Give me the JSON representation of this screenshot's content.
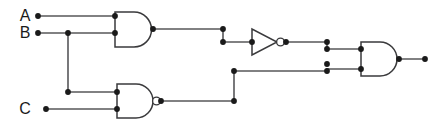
{
  "diagram": {
    "type": "digital-logic-schematic",
    "canvas": {
      "width": 444,
      "height": 126,
      "background": "#ffffff"
    },
    "colors": {
      "wire": "#58585a",
      "gate_outline": "#3a3a3c",
      "gate_fill": "#ffffff",
      "node": "#1a1a1a",
      "label": "#1a1a1a"
    }
  },
  "inputs": [
    {
      "id": "A",
      "label": "A",
      "label_x": 25,
      "label_y": 16,
      "terminal_x": 38,
      "terminal_y": 16
    },
    {
      "id": "B",
      "label": "B",
      "label_x": 25,
      "label_y": 33,
      "terminal_x": 38,
      "terminal_y": 33
    },
    {
      "id": "C",
      "label": "C",
      "label_x": 25,
      "label_y": 109,
      "terminal_x": 46,
      "terminal_y": 109
    }
  ],
  "gates": [
    {
      "id": "and1",
      "type": "AND",
      "label": "AND",
      "inverted_output": false,
      "x": 115,
      "y": 12,
      "width": 38,
      "height": 35,
      "inputs": [
        "A",
        "B"
      ],
      "output_node": {
        "x": 153,
        "y": 29
      }
    },
    {
      "id": "nand1",
      "type": "NAND",
      "label": "NAND",
      "inverted_output": true,
      "x": 117,
      "y": 84,
      "width": 38,
      "height": 34,
      "inputs": [
        "B",
        "C"
      ],
      "output_node": {
        "x": 161,
        "y": 101
      }
    },
    {
      "id": "not1",
      "type": "NOT",
      "label": "NOT",
      "inverted_output": true,
      "x": 252,
      "y": 29,
      "width": 30,
      "height": 26,
      "inputs": [
        "and1"
      ],
      "output_node": {
        "x": 286,
        "y": 42
      }
    },
    {
      "id": "and2",
      "type": "AND",
      "label": "AND",
      "inverted_output": false,
      "x": 361,
      "y": 42,
      "width": 38,
      "height": 34,
      "inputs": [
        "not1",
        "nand1"
      ],
      "output_node": {
        "x": 399,
        "y": 59
      }
    }
  ],
  "output": {
    "id": "OUT",
    "label": "",
    "terminal_x": 425,
    "terminal_y": 59
  },
  "wires": [
    {
      "id": "a-to-and1",
      "from": "A",
      "to": "and1.in1",
      "path": "M38,16 L115,16"
    },
    {
      "id": "b-to-and1",
      "from": "B",
      "to": "and1.in2",
      "path": "M38,33 L115,33"
    },
    {
      "id": "b-branch-down",
      "from": "B",
      "to": "nand1.in1",
      "path": "M68,33 L68,92 L117,92"
    },
    {
      "id": "c-to-nand1",
      "from": "C",
      "to": "nand1.in2",
      "path": "M46,109 L117,109"
    },
    {
      "id": "and1-to-not1",
      "from": "and1",
      "to": "not1.in",
      "path": "M153,29 L223,29 L223,42 L252,42"
    },
    {
      "id": "not1-to-and2",
      "from": "not1",
      "to": "and2.in1",
      "path": "M286,42 L327,42 L327,49 L361,49"
    },
    {
      "id": "nand1-to-and2",
      "from": "nand1",
      "to": "and2.in2",
      "path": "M161,101 L234,101 L234,71 L327,71 L327,69 L361,69"
    },
    {
      "id": "and2-to-out",
      "from": "and2",
      "to": "OUT",
      "path": "M399,59 L425,59"
    }
  ],
  "junction_dots": [
    {
      "id": "dot-a-terminal",
      "x": 38,
      "y": 16
    },
    {
      "id": "dot-b-terminal",
      "x": 38,
      "y": 33
    },
    {
      "id": "dot-c-terminal",
      "x": 46,
      "y": 109
    },
    {
      "id": "dot-b-branch",
      "x": 68,
      "y": 33
    },
    {
      "id": "dot-b-branch-corner",
      "x": 68,
      "y": 92
    },
    {
      "id": "dot-and1-in1",
      "x": 115,
      "y": 16
    },
    {
      "id": "dot-and1-in2",
      "x": 115,
      "y": 33
    },
    {
      "id": "dot-and1-out",
      "x": 153,
      "y": 29
    },
    {
      "id": "dot-nand1-in1",
      "x": 117,
      "y": 92
    },
    {
      "id": "dot-nand1-in2",
      "x": 117,
      "y": 109
    },
    {
      "id": "dot-nand1-out",
      "x": 161,
      "y": 101
    },
    {
      "id": "dot-and1-corner-top",
      "x": 223,
      "y": 29
    },
    {
      "id": "dot-and1-corner-bottom",
      "x": 223,
      "y": 42
    },
    {
      "id": "dot-not1-in",
      "x": 252,
      "y": 42
    },
    {
      "id": "dot-not1-out",
      "x": 286,
      "y": 42
    },
    {
      "id": "dot-nand1-corner-bottom",
      "x": 234,
      "y": 101
    },
    {
      "id": "dot-nand1-corner-top",
      "x": 234,
      "y": 71
    },
    {
      "id": "dot-and2-feed-upper-a",
      "x": 327,
      "y": 42
    },
    {
      "id": "dot-and2-feed-upper-b",
      "x": 327,
      "y": 49
    },
    {
      "id": "dot-and2-feed-lower-a",
      "x": 327,
      "y": 64
    },
    {
      "id": "dot-and2-feed-lower-b",
      "x": 327,
      "y": 71
    },
    {
      "id": "dot-and2-in1",
      "x": 361,
      "y": 49
    },
    {
      "id": "dot-and2-in2",
      "x": 361,
      "y": 69
    },
    {
      "id": "dot-and2-out",
      "x": 399,
      "y": 59
    },
    {
      "id": "dot-out-terminal",
      "x": 425,
      "y": 59
    }
  ]
}
